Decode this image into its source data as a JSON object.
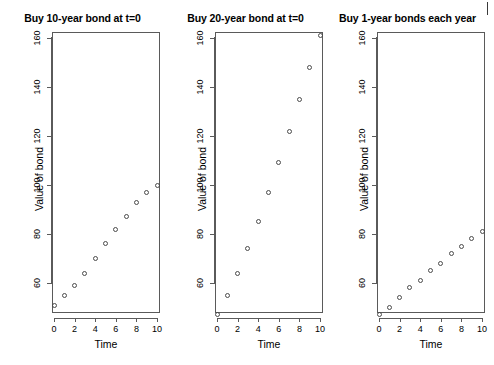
{
  "figure": {
    "background": "#ffffff",
    "point_color": "#4b4b4b",
    "axis_color": "#5a5a5a"
  },
  "chart_data": [
    {
      "type": "scatter",
      "title": "Buy 10-year bond at t=0",
      "xlabel": "Time",
      "ylabel": "Value of bond",
      "x": [
        0,
        1,
        2,
        3,
        4,
        5,
        6,
        7,
        8,
        9,
        10
      ],
      "values": [
        51,
        55,
        59,
        64,
        70,
        76,
        82,
        87,
        93,
        97,
        100
      ],
      "xlim": [
        -0.4,
        10.4
      ],
      "ylim": [
        47,
        165
      ],
      "xticks": [
        0,
        2,
        4,
        6,
        8,
        10
      ],
      "xticklabels": [
        "0",
        "2",
        "4",
        "6",
        "8",
        "10"
      ],
      "yticks": [
        60,
        80,
        100,
        120,
        140,
        160
      ],
      "yticklabels": [
        "60",
        "80",
        "100",
        "120",
        "140",
        "160"
      ],
      "grid": false,
      "legend": "none"
    },
    {
      "type": "scatter",
      "title": "Buy 20-year bond at t=0",
      "xlabel": "Time",
      "ylabel": "Value of bond",
      "x": [
        0,
        1,
        2,
        3,
        4,
        5,
        6,
        7,
        8,
        9,
        10
      ],
      "values": [
        47,
        55,
        64,
        74,
        85,
        97,
        109,
        122,
        135,
        148,
        161
      ],
      "xlim": [
        -0.4,
        10.4
      ],
      "ylim": [
        47,
        165
      ],
      "xticks": [
        0,
        2,
        4,
        6,
        8,
        10
      ],
      "xticklabels": [
        "0",
        "2",
        "4",
        "6",
        "8",
        "10"
      ],
      "yticks": [
        60,
        80,
        100,
        120,
        140,
        160
      ],
      "yticklabels": [
        "60",
        "80",
        "100",
        "120",
        "140",
        "160"
      ],
      "grid": false,
      "legend": "none"
    },
    {
      "type": "scatter",
      "title": "Buy 1-year bonds each year",
      "xlabel": "Time",
      "ylabel": "Value of bond",
      "x": [
        0,
        1,
        2,
        3,
        4,
        5,
        6,
        7,
        8,
        9,
        10
      ],
      "values": [
        47,
        50,
        54,
        58,
        61,
        65,
        68,
        72,
        75,
        78,
        81
      ],
      "xlim": [
        -0.4,
        10.4
      ],
      "ylim": [
        47,
        165
      ],
      "xticks": [
        0,
        2,
        4,
        6,
        8,
        10
      ],
      "xticklabels": [
        "0",
        "2",
        "4",
        "6",
        "8",
        "10"
      ],
      "yticks": [
        60,
        80,
        100,
        120,
        140,
        160
      ],
      "yticklabels": [
        "60",
        "80",
        "100",
        "120",
        "140",
        "160"
      ],
      "grid": false,
      "legend": "none"
    }
  ]
}
